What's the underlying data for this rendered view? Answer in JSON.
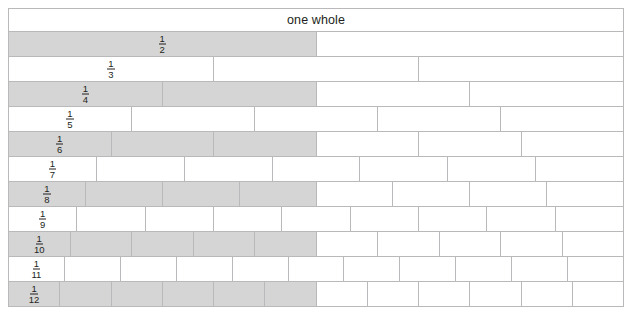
{
  "diagram": {
    "title": "one whole",
    "shade_color": "#d5d5d5",
    "line_color": "#b9b9bb",
    "text_color": "#231f20",
    "background": "#ffffff"
  },
  "chart_data": {
    "type": "bar",
    "title": "one whole",
    "xlabel": "",
    "ylabel": "",
    "categories": [
      "1/2",
      "1/3",
      "1/4",
      "1/5",
      "1/6",
      "1/7",
      "1/8",
      "1/9",
      "1/10",
      "1/11",
      "1/12"
    ],
    "values": [
      2,
      3,
      4,
      5,
      6,
      7,
      8,
      9,
      10,
      11,
      12
    ],
    "rows": [
      {
        "label": "1/2",
        "numerator": 1,
        "denominator": 2,
        "parts": 2,
        "shaded_parts": 1
      },
      {
        "label": "1/3",
        "numerator": 1,
        "denominator": 3,
        "parts": 3,
        "shaded_parts": 0
      },
      {
        "label": "1/4",
        "numerator": 1,
        "denominator": 4,
        "parts": 4,
        "shaded_parts": 2
      },
      {
        "label": "1/5",
        "numerator": 1,
        "denominator": 5,
        "parts": 5,
        "shaded_parts": 0
      },
      {
        "label": "1/6",
        "numerator": 1,
        "denominator": 6,
        "parts": 6,
        "shaded_parts": 3
      },
      {
        "label": "1/7",
        "numerator": 1,
        "denominator": 7,
        "parts": 7,
        "shaded_parts": 0
      },
      {
        "label": "1/8",
        "numerator": 1,
        "denominator": 8,
        "parts": 8,
        "shaded_parts": 4
      },
      {
        "label": "1/9",
        "numerator": 1,
        "denominator": 9,
        "parts": 9,
        "shaded_parts": 0
      },
      {
        "label": "1/10",
        "numerator": 1,
        "denominator": 10,
        "parts": 10,
        "shaded_parts": 5
      },
      {
        "label": "1/11",
        "numerator": 1,
        "denominator": 11,
        "parts": 11,
        "shaded_parts": 0
      },
      {
        "label": "1/12",
        "numerator": 1,
        "denominator": 12,
        "parts": 12,
        "shaded_parts": 6
      }
    ]
  }
}
